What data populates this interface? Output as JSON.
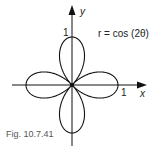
{
  "figure": {
    "caption": "Fig. 10.7.41",
    "equation": "r = cos (2θ)",
    "axes": {
      "x_label": "x",
      "y_label": "y",
      "x_tick": "1",
      "y_tick": "1"
    }
  },
  "chart_data": {
    "type": "line",
    "title": "r = cos (2θ)",
    "xlabel": "x",
    "ylabel": "y",
    "curve": "polar rose r = cos(2θ), four petals along the axes",
    "xlim": [
      -1.2,
      1.2
    ],
    "ylim": [
      -1.2,
      1.7
    ],
    "ticks": {
      "x": [
        1
      ],
      "y": [
        1
      ]
    },
    "petal_tips": [
      [
        1,
        0
      ],
      [
        0,
        1
      ],
      [
        -1,
        0
      ],
      [
        0,
        -1
      ]
    ],
    "grid": false
  }
}
